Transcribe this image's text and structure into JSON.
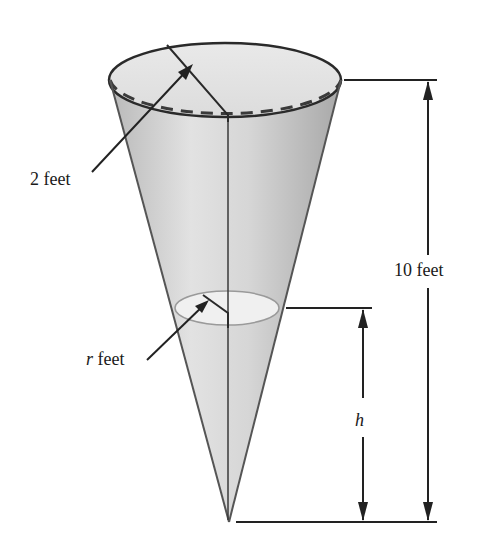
{
  "diagram": {
    "type": "inverted cone with water level",
    "labels": {
      "top_radius": "2 feet",
      "water_radius_var": "r",
      "water_radius_unit": " feet",
      "total_height": "10 feet",
      "water_height": "h"
    },
    "colors": {
      "cone_fill_light": "#e6e6e6",
      "cone_fill_dark": "#a9a9a9",
      "water_surface": "#efefef",
      "line": "#222222",
      "background": "#ffffff"
    }
  }
}
